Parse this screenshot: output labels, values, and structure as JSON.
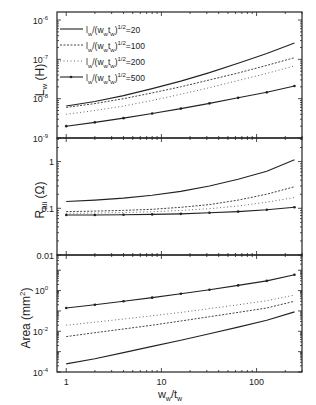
{
  "chart_data": {
    "type": "line",
    "layout": "3 stacked panels sharing a log x-axis",
    "xlabel": "w_w/t_w",
    "x_scale": "log",
    "xlim": [
      0.8,
      300
    ],
    "x_ticks": [
      "1",
      "10",
      "100"
    ],
    "x": [
      1,
      2,
      4,
      8,
      16,
      32,
      64,
      128,
      250
    ],
    "legend": {
      "position": "upper-left of top panel",
      "entries": [
        {
          "label": "l_w/(w_w t_w)^1/2=20",
          "style": "solid"
        },
        {
          "label": "l_w/(w_w t_w)^1/2=100",
          "style": "dashed"
        },
        {
          "label": "l_w/(w_w t_w)^1/2=200",
          "style": "dotted"
        },
        {
          "label": "l_w/(w_w t_w)^1/2=500",
          "style": "solid-marker"
        }
      ]
    },
    "panels": [
      {
        "ylabel": "L_w (H)",
        "y_scale": "log",
        "ylim": [
          1e-09,
          1.6e-06
        ],
        "y_ticks": [
          "10^-6",
          "10^-7",
          "10^-8",
          "10^-9"
        ],
        "series": [
          {
            "name": "=20",
            "values": [
              6.5e-09,
              8.5e-09,
              1.2e-08,
              1.8e-08,
              2.8e-08,
              4.6e-08,
              8e-08,
              1.4e-07,
              2.6e-07
            ]
          },
          {
            "name": "=100",
            "values": [
              6e-09,
              7.5e-09,
              1e-08,
              1.4e-08,
              2e-08,
              3e-08,
              4.5e-08,
              7e-08,
              1.1e-07
            ]
          },
          {
            "name": "=200",
            "values": [
              4e-09,
              5e-09,
              6.5e-09,
              9e-09,
              1.3e-08,
              1.9e-08,
              2.9e-08,
              4.4e-08,
              6.8e-08
            ]
          },
          {
            "name": "=500",
            "values": [
              2e-09,
              2.5e-09,
              3.2e-09,
              4.2e-09,
              5.6e-09,
              7.6e-09,
              1.05e-08,
              1.45e-08,
              2.1e-08
            ]
          }
        ]
      },
      {
        "ylabel": "R_ali (Ω)",
        "y_scale": "log",
        "ylim": [
          0.01,
          3.2
        ],
        "y_ticks": [
          "1",
          "0.1",
          "0.01"
        ],
        "series": [
          {
            "name": "=20",
            "values": [
              0.14,
              0.15,
              0.165,
              0.19,
              0.23,
              0.3,
              0.42,
              0.62,
              1.1
            ]
          },
          {
            "name": "=100",
            "values": [
              0.085,
              0.087,
              0.09,
              0.095,
              0.105,
              0.12,
              0.15,
              0.2,
              0.29
            ]
          },
          {
            "name": "=200",
            "values": [
              0.078,
              0.079,
              0.081,
              0.084,
              0.09,
              0.098,
              0.112,
              0.135,
              0.17
            ]
          },
          {
            "name": "=500",
            "values": [
              0.072,
              0.072,
              0.073,
              0.074,
              0.076,
              0.08,
              0.085,
              0.093,
              0.105
            ]
          }
        ]
      },
      {
        "ylabel": "Area (mm^2)",
        "y_scale": "log",
        "ylim": [
          0.0001,
          56
        ],
        "y_ticks": [
          "10^0",
          "10^-2",
          "10^-4"
        ],
        "series": [
          {
            "name": "=20",
            "values": [
              0.00025,
              0.00045,
              0.0009,
              0.0018,
              0.0036,
              0.0075,
              0.016,
              0.035,
              0.09
            ]
          },
          {
            "name": "=100",
            "values": [
              0.0055,
              0.0085,
              0.013,
              0.02,
              0.032,
              0.052,
              0.085,
              0.14,
              0.3
            ]
          },
          {
            "name": "=200",
            "values": [
              0.02,
              0.028,
              0.04,
              0.058,
              0.085,
              0.13,
              0.2,
              0.32,
              0.6
            ]
          },
          {
            "name": "=500",
            "values": [
              0.14,
              0.2,
              0.3,
              0.45,
              0.7,
              1.1,
              1.8,
              3.0,
              6.0
            ]
          }
        ]
      }
    ]
  },
  "labels": {
    "panel0_ylabel": "L",
    "panel0_ylabel_sub": "w",
    "panel0_ylabel_unit": "(H)",
    "panel1_ylabel": "R",
    "panel1_ylabel_sub": "ali",
    "panel1_ylabel_unit": "(Ω)",
    "panel2_ylabel": "Area (mm",
    "panel2_ylabel_sup": "2",
    "panel2_ylabel_end": ")",
    "xlabel_main": "w",
    "xlabel_sub": "w",
    "xlabel_mid": "/t",
    "xlabel_sub2": "w"
  }
}
